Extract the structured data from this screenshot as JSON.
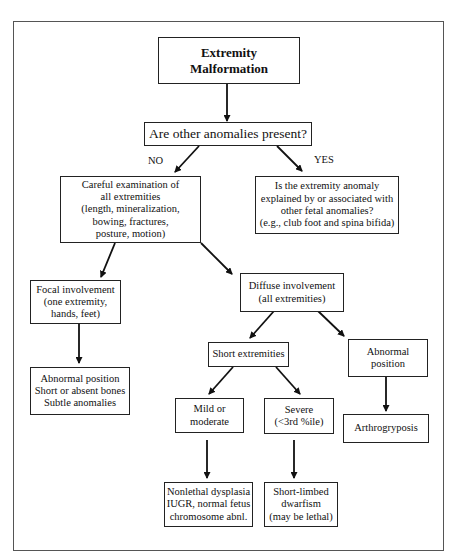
{
  "diagram": {
    "type": "flowchart",
    "nodes": {
      "root": {
        "lines": [
          "Extremity",
          "Malformation"
        ]
      },
      "question": {
        "lines": [
          "Are other anomalies present?"
        ]
      },
      "careful_exam": {
        "lines": [
          "Careful examination of",
          "all extremities",
          "(length, mineralization,",
          "bowing, fractures,",
          "posture, motion)"
        ]
      },
      "explained": {
        "lines": [
          "Is the extremity anomaly",
          "explained by or associated with",
          "other fetal anomalies?",
          "(e.g., club foot and spina bifida)"
        ]
      },
      "focal": {
        "lines": [
          "Focal involvement",
          "(one extremity,",
          "hands, feet)"
        ]
      },
      "diffuse": {
        "lines": [
          "Diffuse involvement",
          "(all extremities)"
        ]
      },
      "focal_findings": {
        "lines": [
          "Abnormal position",
          "Short or absent bones",
          "Subtle anomalies"
        ]
      },
      "short_extremities": {
        "lines": [
          "Short extremities"
        ]
      },
      "abnormal_position": {
        "lines": [
          "Abnormal",
          "position"
        ]
      },
      "mild": {
        "lines": [
          "Mild or",
          "moderate"
        ]
      },
      "severe": {
        "lines": [
          "Severe",
          "(<3rd %ile)"
        ]
      },
      "arthrogryposis": {
        "lines": [
          "Arthrogryposis"
        ]
      },
      "nonlethal": {
        "lines": [
          "Nonlethal dysplasia",
          "IUGR, normal fetus",
          "chromosome abnl."
        ]
      },
      "dwarfism": {
        "lines": [
          "Short-limbed",
          "dwarfism",
          "(may be lethal)"
        ]
      }
    },
    "edge_labels": {
      "no": "NO",
      "yes": "YES"
    },
    "edges": [
      {
        "from": "root",
        "to": "question"
      },
      {
        "from": "question",
        "to": "careful_exam",
        "label": "NO"
      },
      {
        "from": "question",
        "to": "explained",
        "label": "YES"
      },
      {
        "from": "careful_exam",
        "to": "focal"
      },
      {
        "from": "careful_exam",
        "to": "diffuse"
      },
      {
        "from": "focal",
        "to": "focal_findings"
      },
      {
        "from": "diffuse",
        "to": "short_extremities"
      },
      {
        "from": "diffuse",
        "to": "abnormal_position"
      },
      {
        "from": "short_extremities",
        "to": "mild"
      },
      {
        "from": "short_extremities",
        "to": "severe"
      },
      {
        "from": "abnormal_position",
        "to": "arthrogryposis"
      },
      {
        "from": "mild",
        "to": "nonlethal"
      },
      {
        "from": "severe",
        "to": "dwarfism"
      }
    ]
  }
}
